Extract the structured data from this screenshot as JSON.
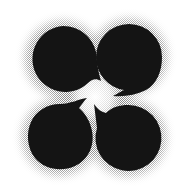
{
  "image": {
    "description": "Four black comma (tomoe) shapes arranged in a 2x2 grid, tails curling toward a glowing white center, on white background with halftone gray halo",
    "colors": {
      "background": "#ffffff",
      "shape": "#141414",
      "halo": "#8c8c8c",
      "center_glow": "#ffffff"
    },
    "shapes": [
      {
        "name": "top-left",
        "cx": 63,
        "cy": 59,
        "r": 33
      },
      {
        "name": "top-right",
        "cx": 129,
        "cy": 57,
        "r": 33
      },
      {
        "name": "bottom-left",
        "cx": 60,
        "cy": 137,
        "r": 33
      },
      {
        "name": "bottom-right",
        "cx": 128,
        "cy": 138,
        "r": 33
      }
    ]
  }
}
